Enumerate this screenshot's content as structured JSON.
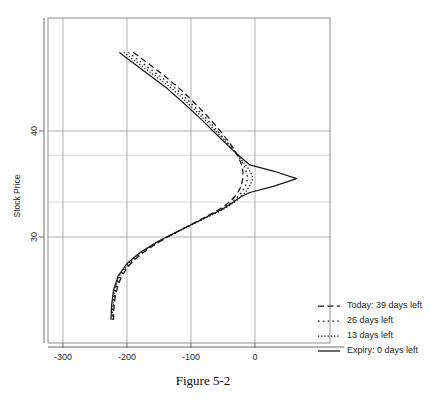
{
  "figure": {
    "caption": "Figure 5-2"
  },
  "chart_data": {
    "type": "line",
    "title": "",
    "subtitle": "",
    "xlabel": "",
    "ylabel": "Stock Price",
    "orientation": "profit on x-axis, stock price on y-axis",
    "grid": true,
    "legend_position": "bottom-right outside plot",
    "xlim": [
      -340,
      90
    ],
    "ylim": [
      21.8,
      47.5
    ],
    "xticks": [
      -300,
      -200,
      -100,
      0
    ],
    "xticklabels": [
      "-300",
      "-200",
      "-100",
      "0"
    ],
    "yticks": [
      30,
      40
    ],
    "yticklabels": [
      "30",
      "40"
    ],
    "y_gridlines_major": [
      30,
      40
    ],
    "y_gridlines_minor": [
      33.3,
      37.7
    ],
    "x_gridlines": [
      -300,
      -200,
      -100,
      0
    ],
    "peak_stock_price": 35.5,
    "peak_profit": 65,
    "lower_asymptote_profit": -222,
    "series": [
      {
        "name": "Today: 39 days left",
        "days_left": 39,
        "dash": "dashed",
        "dasharray": "6,3.5",
        "points": [
          [
            -190,
            47.4
          ],
          [
            -150,
            45.6
          ],
          [
            -118,
            44.0
          ],
          [
            -92,
            42.5
          ],
          [
            -70,
            41.1
          ],
          [
            -53,
            39.9
          ],
          [
            -40,
            38.9
          ],
          [
            -31,
            38.1
          ],
          [
            -25,
            37.4
          ],
          [
            -21,
            36.8
          ],
          [
            -19,
            36.2
          ],
          [
            -19,
            35.6
          ],
          [
            -21,
            35.0
          ],
          [
            -25,
            34.4
          ],
          [
            -32,
            33.8
          ],
          [
            -42,
            33.2
          ],
          [
            -56,
            32.6
          ],
          [
            -74,
            32.0
          ],
          [
            -96,
            31.3
          ],
          [
            -121,
            30.5
          ],
          [
            -148,
            29.6
          ],
          [
            -173,
            28.6
          ],
          [
            -194,
            27.5
          ],
          [
            -208,
            26.3
          ],
          [
            -216,
            25.0
          ],
          [
            -220,
            23.6
          ],
          [
            -221,
            22.2
          ]
        ]
      },
      {
        "name": "26 days left",
        "days_left": 26,
        "dash": "dotted-sparse",
        "dasharray": "1.6,3.2",
        "points": [
          [
            -198,
            47.4
          ],
          [
            -158,
            45.6
          ],
          [
            -124,
            44.0
          ],
          [
            -98,
            42.5
          ],
          [
            -75,
            41.1
          ],
          [
            -57,
            39.9
          ],
          [
            -43,
            38.9
          ],
          [
            -32,
            38.1
          ],
          [
            -24,
            37.4
          ],
          [
            -18,
            36.8
          ],
          [
            -14,
            36.2
          ],
          [
            -12,
            35.6
          ],
          [
            -14,
            35.0
          ],
          [
            -19,
            34.4
          ],
          [
            -27,
            33.8
          ],
          [
            -38,
            33.2
          ],
          [
            -53,
            32.6
          ],
          [
            -72,
            32.0
          ],
          [
            -95,
            31.3
          ],
          [
            -121,
            30.5
          ],
          [
            -149,
            29.6
          ],
          [
            -175,
            28.6
          ],
          [
            -196,
            27.5
          ],
          [
            -210,
            26.3
          ],
          [
            -218,
            25.0
          ],
          [
            -221,
            23.6
          ],
          [
            -222,
            22.2
          ]
        ]
      },
      {
        "name": "13 days left",
        "days_left": 13,
        "dash": "dotted-dense",
        "dasharray": "1.3,1.9",
        "points": [
          [
            -205,
            47.4
          ],
          [
            -165,
            45.6
          ],
          [
            -130,
            44.0
          ],
          [
            -103,
            42.5
          ],
          [
            -79,
            41.1
          ],
          [
            -60,
            39.9
          ],
          [
            -45,
            38.9
          ],
          [
            -33,
            38.1
          ],
          [
            -23,
            37.4
          ],
          [
            -15,
            36.8
          ],
          [
            -8,
            36.2
          ],
          [
            -4,
            35.6
          ],
          [
            -7,
            35.0
          ],
          [
            -13,
            34.4
          ],
          [
            -22,
            33.8
          ],
          [
            -34,
            33.2
          ],
          [
            -50,
            32.6
          ],
          [
            -70,
            32.0
          ],
          [
            -94,
            31.3
          ],
          [
            -121,
            30.5
          ],
          [
            -150,
            29.6
          ],
          [
            -177,
            28.6
          ],
          [
            -198,
            27.5
          ],
          [
            -212,
            26.3
          ],
          [
            -219,
            25.0
          ],
          [
            -222,
            23.6
          ],
          [
            -223,
            22.2
          ]
        ]
      },
      {
        "name": "Expiry: 0 days left",
        "days_left": 0,
        "dash": "solid",
        "dasharray": "none",
        "points": [
          [
            -212,
            47.4
          ],
          [
            -172,
            45.6
          ],
          [
            -137,
            44.0
          ],
          [
            -109,
            42.5
          ],
          [
            -84,
            41.1
          ],
          [
            -64,
            39.9
          ],
          [
            -47,
            38.9
          ],
          [
            -33,
            38.1
          ],
          [
            -20,
            37.4
          ],
          [
            -8,
            36.8
          ],
          [
            30,
            36.2
          ],
          [
            65,
            35.5
          ],
          [
            30,
            34.8
          ],
          [
            -8,
            34.2
          ],
          [
            -22,
            33.8
          ],
          [
            -36,
            33.2
          ],
          [
            -52,
            32.6
          ],
          [
            -72,
            32.0
          ],
          [
            -95,
            31.3
          ],
          [
            -122,
            30.5
          ],
          [
            -151,
            29.6
          ],
          [
            -178,
            28.6
          ],
          [
            -200,
            27.5
          ],
          [
            -214,
            26.3
          ],
          [
            -221,
            25.0
          ],
          [
            -224,
            23.6
          ],
          [
            -225,
            22.2
          ]
        ]
      }
    ],
    "legend_entries": [
      "Today: 39 days left",
      "26 days left",
      "13 days left",
      "Expiry: 0 days left"
    ]
  }
}
